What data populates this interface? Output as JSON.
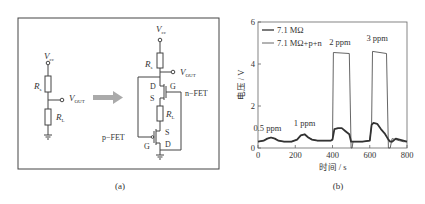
{
  "panel_a": {
    "caption": "(a)",
    "left_circuit": {
      "vcc": "V",
      "vcc_sub": "cc",
      "rs": "R",
      "rs_sub": "s",
      "rl": "R",
      "rl_sub": "L",
      "vout": "V",
      "vout_sub": "OUT"
    },
    "right_circuit": {
      "vcc": "V",
      "vcc_sub": "cc",
      "rs": "R",
      "rs_sub": "s",
      "rl": "R",
      "rl_sub": "L",
      "vout": "V",
      "vout_sub": "OUT",
      "nfet_label": "n−FET",
      "pfet_label": "p−FET",
      "n_d": "D",
      "n_g": "G",
      "n_s": "S",
      "p_s": "S",
      "p_g": "G",
      "p_d": "D"
    }
  },
  "panel_b": {
    "caption": "(b)"
  },
  "chart_data": {
    "type": "line",
    "title": "",
    "xlabel": "时间 / s",
    "ylabel": "电压 / V",
    "xlim": [
      0,
      800
    ],
    "ylim": [
      0,
      6
    ],
    "xticks": [
      "0",
      "200",
      "400",
      "600",
      "800"
    ],
    "yticks": [
      "0",
      "2",
      "4",
      "6"
    ],
    "grid": false,
    "legend_position": "upper left",
    "series": [
      {
        "name": "7.1 MΩ",
        "x": [
          0,
          30,
          50,
          70,
          90,
          110,
          140,
          180,
          210,
          230,
          250,
          270,
          290,
          320,
          350,
          390,
          400,
          410,
          430,
          450,
          470,
          490,
          500,
          510,
          520,
          560,
          600,
          610,
          620,
          640,
          660,
          680,
          700,
          710,
          720,
          740,
          760,
          780,
          800
        ],
        "y": [
          0.3,
          0.35,
          0.45,
          0.5,
          0.45,
          0.35,
          0.3,
          0.3,
          0.4,
          0.6,
          0.65,
          0.5,
          0.4,
          0.35,
          0.35,
          0.35,
          0.4,
          0.9,
          0.95,
          0.95,
          0.8,
          0.65,
          0.3,
          0.3,
          0.3,
          0.3,
          0.35,
          1.1,
          1.2,
          1.15,
          0.9,
          0.7,
          0.4,
          0.3,
          0.3,
          0.45,
          0.4,
          0.35,
          0.3
        ]
      },
      {
        "name": "7.1 MΩ+p+n",
        "x": [
          0,
          30,
          50,
          70,
          90,
          110,
          140,
          180,
          210,
          230,
          250,
          270,
          290,
          320,
          350,
          390,
          400,
          405,
          490,
          500,
          505,
          510,
          520,
          560,
          600,
          610,
          615,
          690,
          700,
          710,
          720,
          740,
          760,
          780,
          800
        ],
        "y": [
          0.3,
          0.35,
          0.45,
          0.5,
          0.45,
          0.35,
          0.3,
          0.3,
          0.4,
          0.6,
          0.65,
          0.5,
          0.4,
          0.35,
          0.35,
          0.35,
          0.4,
          4.55,
          4.5,
          0.0,
          0.0,
          0.3,
          0.3,
          0.3,
          0.35,
          1.1,
          4.6,
          4.5,
          0.0,
          0.0,
          0.45,
          0.4,
          0.35,
          0.3,
          0.3
        ]
      }
    ],
    "annotations": [
      {
        "text": "0.5 ppm",
        "x": 50,
        "y": 0.8
      },
      {
        "text": "1 ppm",
        "x": 250,
        "y": 1.05
      },
      {
        "text": "2 ppm",
        "x": 440,
        "y": 4.9
      },
      {
        "text": "3 ppm",
        "x": 640,
        "y": 5.1
      }
    ]
  }
}
